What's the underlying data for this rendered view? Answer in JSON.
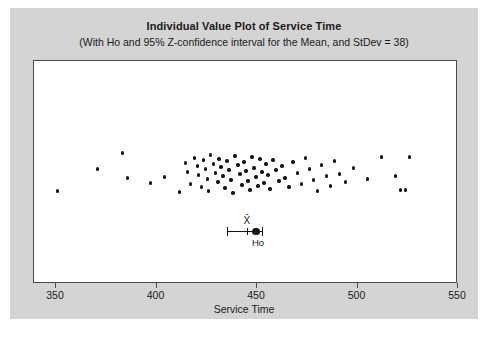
{
  "chart_data": {
    "type": "scatter",
    "title": "Individual Value Plot of Service Time",
    "subtitle": "(With Ho and 95% Z-confidence interval for the Mean, and StDev = 38)",
    "xlabel": "Service Time",
    "ylabel": "",
    "xlim": [
      339,
      550
    ],
    "xticks": [
      350,
      400,
      450,
      500,
      550
    ],
    "xtick_labels": [
      "350",
      "400",
      "450",
      "500",
      "550"
    ],
    "grid": false,
    "legend": null,
    "series": [
      {
        "name": "Service Time individual values",
        "x": [
          350.7,
          370.5,
          383.0,
          385.5,
          397.0,
          404.0,
          411.5,
          414.5,
          415.5,
          417.0,
          419.0,
          420.5,
          421.0,
          422.5,
          423.5,
          424.5,
          425.5,
          426.0,
          427.0,
          428.5,
          429.5,
          430.5,
          431.0,
          432.0,
          433.0,
          434.0,
          435.0,
          436.0,
          437.0,
          438.0,
          439.0,
          440.5,
          441.5,
          442.5,
          443.5,
          444.5,
          445.5,
          446.5,
          447.5,
          448.5,
          449.5,
          450.5,
          451.5,
          452.5,
          453.5,
          454.5,
          455.5,
          456.5,
          458.0,
          459.5,
          461.0,
          462.5,
          464.0,
          466.0,
          468.0,
          470.0,
          472.0,
          474.0,
          476.0,
          478.0,
          480.0,
          482.0,
          484.5,
          486.5,
          488.5,
          491.0,
          494.0,
          498.0,
          505.0,
          512.0,
          519.0,
          521.5,
          524.0,
          526.0
        ],
        "y_jitter": [
          190,
          168,
          152,
          177,
          182,
          176,
          191,
          162,
          171,
          183,
          157,
          165,
          174,
          186,
          159,
          168,
          178,
          190,
          154,
          163,
          172,
          181,
          158,
          166,
          175,
          187,
          160,
          169,
          179,
          192,
          155,
          164,
          173,
          184,
          161,
          170,
          180,
          189,
          156,
          167,
          176,
          185,
          158,
          171,
          182,
          163,
          174,
          188,
          159,
          169,
          180,
          165,
          177,
          186,
          161,
          172,
          183,
          157,
          168,
          179,
          190,
          164,
          175,
          185,
          160,
          173,
          181,
          167,
          178,
          156,
          175,
          189,
          189,
          156
        ],
        "n": 74,
        "color": "#141414",
        "marker": "circle"
      }
    ],
    "annotations": {
      "mean_label": "X̄",
      "hypothesis_label": "Ho",
      "mean_value": 445.5,
      "hypothesis_value": 450.0,
      "ci_lower": 435.5,
      "ci_upper": 453.0,
      "stdev": 38,
      "confidence_level": "95%"
    }
  },
  "colors": {
    "figure_background": "#d4d4d4",
    "plot_background": "#ffffff",
    "axis": "#4a4a4a",
    "marker": "#141414",
    "text": "#1a1a1a"
  }
}
